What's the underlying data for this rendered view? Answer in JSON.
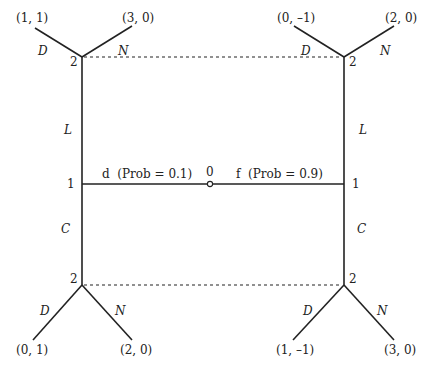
{
  "diagram": {
    "type": "extensive-form game tree",
    "nature_node": {
      "label": "0",
      "left_move": "d  (Prob = 0.1)",
      "right_move": "f  (Prob = 0.9)"
    },
    "player1_nodes": {
      "label": "1",
      "upper_move": "L",
      "lower_move": "C"
    },
    "player2_nodes": {
      "label": "2",
      "move_left": "D",
      "move_right": "N"
    },
    "payoffs": {
      "top_left": {
        "D": "(1, 1)",
        "N": "(3, 0)"
      },
      "top_right": {
        "D": "(0, –1)",
        "N": "(2, 0)"
      },
      "bottom_left": {
        "D": "(0, 1)",
        "N": "(2, 0)"
      },
      "bottom_right": {
        "D": "(1, –1)",
        "N": "(3, 0)"
      }
    }
  }
}
